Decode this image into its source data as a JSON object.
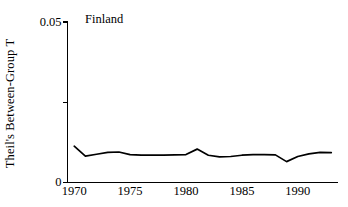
{
  "chart_data": {
    "type": "line",
    "title": "Finland",
    "xlabel": "",
    "ylabel": "Theil's Between-Group T",
    "xlim": [
      1969.4,
      1993.6
    ],
    "ylim": [
      0,
      0.05
    ],
    "grid": false,
    "legend": null,
    "y_ticks": [
      {
        "value": 0,
        "label": "0"
      },
      {
        "value": 0.025,
        "label": ""
      },
      {
        "value": 0.05,
        "label": "0.05"
      }
    ],
    "x_ticks": [
      {
        "value": 1970,
        "label": "1970"
      },
      {
        "value": 1975,
        "label": "1975"
      },
      {
        "value": 1980,
        "label": "1980"
      },
      {
        "value": 1985,
        "label": "1985"
      },
      {
        "value": 1990,
        "label": "1990"
      }
    ],
    "series": [
      {
        "name": "Finland",
        "color": "#000000",
        "x": [
          1970,
          1971,
          1972,
          1973,
          1974,
          1975,
          1976,
          1977,
          1978,
          1979,
          1980,
          1981,
          1982,
          1983,
          1984,
          1985,
          1986,
          1987,
          1988,
          1989,
          1990,
          1991,
          1992,
          1993
        ],
        "values": [
          0.0113,
          0.0082,
          0.0088,
          0.0094,
          0.0095,
          0.0087,
          0.0085,
          0.0085,
          0.0085,
          0.0086,
          0.0087,
          0.0104,
          0.0085,
          0.008,
          0.0081,
          0.0085,
          0.0087,
          0.0087,
          0.0086,
          0.0065,
          0.0081,
          0.0089,
          0.0094,
          0.0093
        ]
      }
    ]
  },
  "axes": {
    "y_axis_label": "Theil's Between-Group T",
    "y_top_label": "0.05",
    "y_bottom_label": "0",
    "x_labels": [
      "1970",
      "1975",
      "1980",
      "1985",
      "1990"
    ]
  },
  "colors": {
    "line": "#000000",
    "axis": "#000000",
    "background": "#ffffff"
  }
}
